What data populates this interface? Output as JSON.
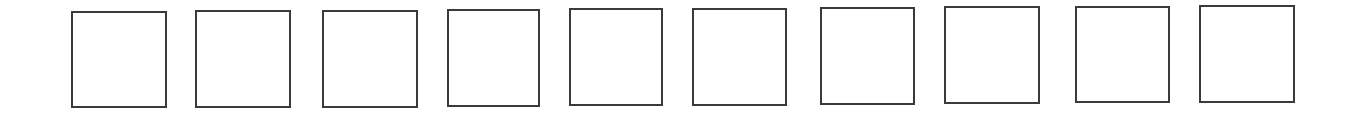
{
  "page": {
    "background": "#ffffff",
    "border_color": "#3a3a3a",
    "border_width": 2
  },
  "boxes": [
    {
      "index": 1,
      "left": 71,
      "top": 11,
      "width": 96,
      "height": 97,
      "value": ""
    },
    {
      "index": 2,
      "left": 195,
      "top": 10,
      "width": 96,
      "height": 98,
      "value": ""
    },
    {
      "index": 3,
      "left": 322,
      "top": 10,
      "width": 96,
      "height": 98,
      "value": ""
    },
    {
      "index": 4,
      "left": 447,
      "top": 9,
      "width": 93,
      "height": 98,
      "value": ""
    },
    {
      "index": 5,
      "left": 569,
      "top": 8,
      "width": 94,
      "height": 98,
      "value": ""
    },
    {
      "index": 6,
      "left": 692,
      "top": 8,
      "width": 95,
      "height": 98,
      "value": ""
    },
    {
      "index": 7,
      "left": 820,
      "top": 7,
      "width": 95,
      "height": 98,
      "value": ""
    },
    {
      "index": 8,
      "left": 944,
      "top": 6,
      "width": 96,
      "height": 98,
      "value": ""
    },
    {
      "index": 9,
      "left": 1075,
      "top": 6,
      "width": 95,
      "height": 97,
      "value": ""
    },
    {
      "index": 10,
      "left": 1199,
      "top": 5,
      "width": 96,
      "height": 98,
      "value": ""
    }
  ]
}
